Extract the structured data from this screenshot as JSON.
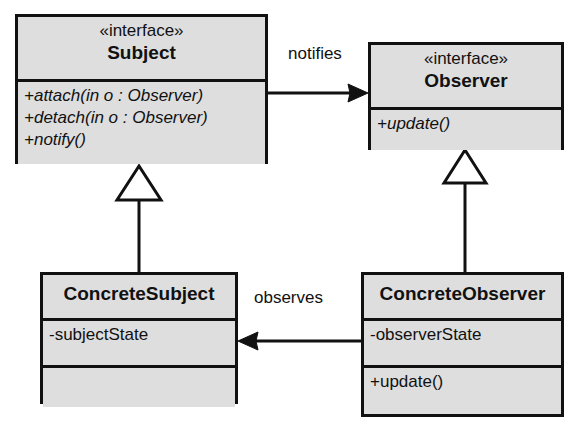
{
  "diagram": {
    "background_color": "#ffffff",
    "box_fill_color": "#dedede",
    "line_color": "#111111"
  },
  "classes": {
    "subject": {
      "stereotype": "«interface»",
      "name": "Subject",
      "operations": [
        "+attach(in o : Observer)",
        "+detach(in o : Observer)",
        "+notify()"
      ]
    },
    "observer": {
      "stereotype": "«interface»",
      "name": "Observer",
      "operations": [
        "+update()"
      ]
    },
    "concrete_subject": {
      "name": "ConcreteSubject",
      "attributes": [
        "-subjectState"
      ],
      "operations": []
    },
    "concrete_observer": {
      "name": "ConcreteObserver",
      "attributes": [
        "-observerState"
      ],
      "operations": [
        "+update()"
      ]
    }
  },
  "relationships": {
    "notifies": {
      "label": "notifies",
      "from": "Subject",
      "to": "Observer",
      "type": "association"
    },
    "observes": {
      "label": "observes",
      "from": "ConcreteObserver",
      "to": "ConcreteSubject",
      "type": "association"
    },
    "subject_generalization": {
      "label": "",
      "from": "ConcreteSubject",
      "to": "Subject",
      "type": "generalization"
    },
    "observer_generalization": {
      "label": "",
      "from": "ConcreteObserver",
      "to": "Observer",
      "type": "generalization"
    }
  }
}
